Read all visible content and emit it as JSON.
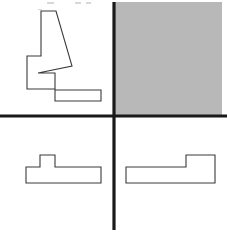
{
  "figure": {
    "title": "",
    "width": 227,
    "height": 232,
    "background_color": "#ffffff",
    "axis_color": "#1a1a1a",
    "outline_color": "#3a3a3a",
    "outline_fill": "#ffffff",
    "shaded_fill": "#b8b8b8"
  },
  "axes": {
    "origin_x": 114,
    "origin_y": 116,
    "vertical": {
      "name": "vertical-axis",
      "x": 114,
      "y1": 2,
      "y2": 230,
      "width": 3.2
    },
    "horizontal": {
      "name": "horizontal-axis",
      "y": 116,
      "x1": 0,
      "x2": 227,
      "width": 3.2
    }
  },
  "quadrants": {
    "top_left": {
      "name": "quadrant-top-left",
      "shape_name": "notched-stepped-polygon",
      "fill": "#ffffff",
      "points": "41,11 56,11 72,66 38,73 55,73 55,90 101,90 101,101 55,101 55,89 27,89 27,56 41,56"
    },
    "top_right": {
      "name": "quadrant-top-right",
      "shape_name": "shaded-square",
      "fill": "#b8b8b8",
      "x": 115,
      "y": 2,
      "width": 107,
      "height": 114
    },
    "bottom_left": {
      "name": "quadrant-bottom-left",
      "shape_name": "tee-polygon",
      "fill": "#ffffff",
      "points": "40,155 55,155 55,167 101,167 101,183 26,183 26,167 40,167"
    },
    "bottom_right": {
      "name": "quadrant-bottom-right",
      "shape_name": "ell-polygon",
      "fill": "#ffffff",
      "points": "186,155 215,155 215,183 126,183 126,167 186,167"
    }
  },
  "artifacts": {
    "name": "scan-specks",
    "color": "#d8d8d8",
    "marks": [
      {
        "x": 47,
        "y": 2,
        "w": 7,
        "h": 2
      },
      {
        "x": 75,
        "y": 2,
        "w": 6,
        "h": 2
      },
      {
        "x": 86,
        "y": 2,
        "w": 5,
        "h": 2
      },
      {
        "x": 38,
        "y": 9,
        "w": 4,
        "h": 1
      }
    ]
  }
}
